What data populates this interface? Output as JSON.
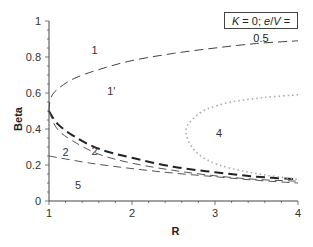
{
  "chart_data": {
    "type": "line",
    "title": "",
    "xlabel": "R",
    "ylabel": "Beta",
    "xlim": [
      1,
      4
    ],
    "ylim": [
      0,
      1
    ],
    "xticks": [
      "1",
      "2",
      "3",
      "4"
    ],
    "yticks": [
      "0",
      "0.2",
      "0.4",
      "0.6",
      "0.8",
      "1"
    ],
    "grid": false,
    "legend": null,
    "annotation_box": {
      "K": "0",
      "e_over_V": "0.5",
      "text": "K = 0; e/V = 0.5"
    },
    "region_labels": [
      {
        "text": "1",
        "R": 1.55,
        "Beta": 0.84
      },
      {
        "text": "1'",
        "R": 1.75,
        "Beta": 0.61
      },
      {
        "text": "2",
        "R": 1.2,
        "Beta": 0.27
      },
      {
        "text": "2",
        "R": 1.55,
        "Beta": 0.28
      },
      {
        "text": "4",
        "R": 3.05,
        "Beta": 0.38
      },
      {
        "text": "5",
        "R": 1.35,
        "Beta": 0.09
      }
    ],
    "series": [
      {
        "name": "upper boundary (region 1)",
        "style": "long-dash thin",
        "x": [
          1.0,
          1.02,
          1.1,
          1.3,
          1.6,
          2.0,
          2.5,
          3.0,
          3.5,
          4.0
        ],
        "y": [
          0.5,
          0.57,
          0.62,
          0.68,
          0.73,
          0.78,
          0.82,
          0.85,
          0.875,
          0.89
        ]
      },
      {
        "name": "thick dashed boundary",
        "style": "long-dash thick",
        "x": [
          1.0,
          1.1,
          1.3,
          1.6,
          2.0,
          2.5,
          3.0,
          3.5,
          4.0
        ],
        "y": [
          0.5,
          0.43,
          0.36,
          0.29,
          0.24,
          0.19,
          0.16,
          0.135,
          0.12
        ]
      },
      {
        "name": "medium dashed boundary",
        "style": "dash thin",
        "x": [
          1.0,
          1.1,
          1.3,
          1.6,
          2.0,
          2.5,
          3.0,
          3.5,
          4.0
        ],
        "y": [
          0.5,
          0.4,
          0.33,
          0.26,
          0.21,
          0.17,
          0.14,
          0.12,
          0.11
        ]
      },
      {
        "name": "lower dashed boundary (region 5)",
        "style": "dash thin",
        "x": [
          1.0,
          1.5,
          2.0,
          2.5,
          3.0,
          3.5,
          4.0
        ],
        "y": [
          0.25,
          0.21,
          0.18,
          0.155,
          0.135,
          0.115,
          0.1
        ]
      },
      {
        "name": "dotted boundary (region 4)",
        "style": "dotted markers",
        "x": [
          4.0,
          3.6,
          3.2,
          2.9,
          2.72,
          2.65,
          2.72,
          2.9,
          3.2,
          3.6,
          4.0
        ],
        "y": [
          0.59,
          0.575,
          0.55,
          0.51,
          0.45,
          0.39,
          0.3,
          0.23,
          0.18,
          0.145,
          0.12
        ]
      }
    ]
  }
}
